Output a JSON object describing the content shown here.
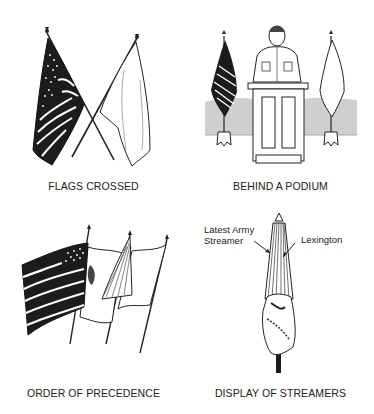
{
  "figure": {
    "panels": [
      {
        "id": "flags-crossed",
        "caption": "FLAGS CROSSED"
      },
      {
        "id": "behind-a-podium",
        "caption": "BEHIND A PODIUM"
      },
      {
        "id": "order-of-precedence",
        "caption": "ORDER OF PRECEDENCE"
      },
      {
        "id": "display-of-streamers",
        "caption": "DISPLAY OF STREAMERS",
        "callouts": {
          "left_line1": "Latest Army",
          "left_line2": "Streamer",
          "right": "Lexington"
        }
      }
    ],
    "colors": {
      "ink": "#1a1a1a",
      "paper": "#ffffff",
      "backdrop": "#cfcfcf"
    }
  }
}
